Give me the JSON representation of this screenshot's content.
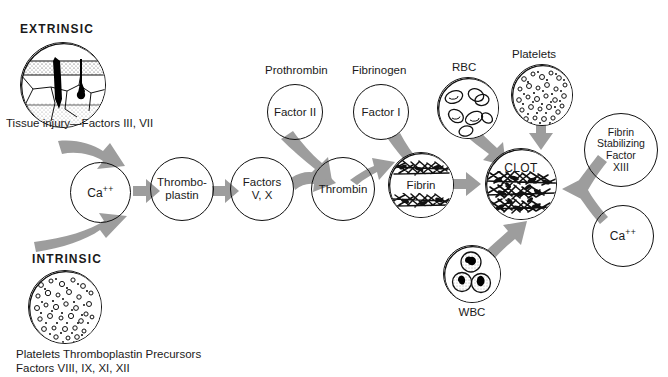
{
  "diagram": {
    "arrow_color": "#9d9d9d",
    "outline_color": "#111111",
    "text_color": "#1a1a1a",
    "background": "#ffffff"
  },
  "pathways": {
    "extrinsic": {
      "heading": "EXTRINSIC",
      "caption": "Tissue injury—Factors III, VII"
    },
    "intrinsic": {
      "heading": "INTRINSIC",
      "caption_line1": "Platelets Thromboplastin Precursors",
      "caption_line2": "Factors VIII, IX, XI, XII"
    }
  },
  "nodes": [
    {
      "id": "calcium-left",
      "label": "Ca",
      "superscript": "++",
      "lines": [
        "Ca++"
      ]
    },
    {
      "id": "thromboplastin",
      "label": "Thrombo-plastin",
      "lines": [
        "Thrombo-",
        "plastin"
      ]
    },
    {
      "id": "factors-v-x",
      "label": "Factors V, X",
      "lines": [
        "Factors",
        "V, X"
      ]
    },
    {
      "id": "factor-ii",
      "label": "Factor II",
      "lines": [
        "Factor II"
      ]
    },
    {
      "id": "thrombin",
      "label": "Thrombin",
      "lines": [
        "Thrombin"
      ]
    },
    {
      "id": "factor-i",
      "label": "Factor I",
      "lines": [
        "Factor I"
      ]
    },
    {
      "id": "fibrin",
      "label": "Fibrin",
      "lines": [
        "Fibrin"
      ]
    },
    {
      "id": "clot",
      "label": "CLOT",
      "lines": [
        "CLOT"
      ]
    },
    {
      "id": "fibrin-stabilizing-factor",
      "label": "Fibrin Stabilizing Factor XIII",
      "lines": [
        "Fibrin",
        "Stabilizing",
        "Factor",
        "XIII"
      ]
    },
    {
      "id": "calcium-right",
      "label": "Ca",
      "superscript": "++",
      "lines": [
        "Ca++"
      ]
    }
  ],
  "labels": {
    "prothrombin": "Prothrombin",
    "fibrinogen": "Fibrinogen",
    "rbc": "RBC",
    "wbc": "WBC",
    "platelets": "Platelets",
    "thromboplastin_l1": "Thrombo-",
    "thromboplastin_l2": "plastin",
    "factors_vx_l1": "Factors",
    "factors_vx_l2": "V, X",
    "factor_ii": "Factor II",
    "factor_i": "Factor I",
    "thrombin": "Thrombin",
    "fibrin": "Fibrin",
    "clot": "CLOT",
    "fsf_l1": "Fibrin",
    "fsf_l2": "Stabilizing",
    "fsf_l3": "Factor",
    "fsf_l4": "XIII",
    "calcium": "Ca",
    "calcium_sup": "++"
  },
  "flow": {
    "steps": [
      {
        "from": "extrinsic",
        "to": "calcium-left"
      },
      {
        "from": "intrinsic",
        "to": "calcium-left"
      },
      {
        "from": "calcium-left",
        "to": "thromboplastin"
      },
      {
        "from": "thromboplastin",
        "to": "factors-v-x"
      },
      {
        "from": "factors-v-x",
        "to": "thrombin"
      },
      {
        "from": "factor-ii",
        "to": "thrombin"
      },
      {
        "from": "thrombin",
        "to": "fibrin"
      },
      {
        "from": "factor-i",
        "to": "fibrin"
      },
      {
        "from": "fibrin",
        "to": "clot"
      },
      {
        "from": "rbc",
        "to": "clot"
      },
      {
        "from": "platelets",
        "to": "clot"
      },
      {
        "from": "wbc",
        "to": "clot"
      },
      {
        "from": "fibrin-stabilizing-factor",
        "to": "clot"
      },
      {
        "from": "calcium-right",
        "to": "clot"
      }
    ]
  }
}
